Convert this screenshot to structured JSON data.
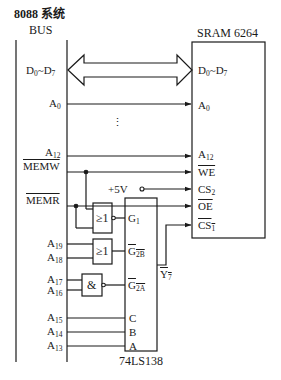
{
  "header": {
    "system_title": "8088 系统",
    "bus_label": "BUS"
  },
  "bus_signals": {
    "data": {
      "base": "D",
      "s1": "0",
      "sep": "~",
      "base2": "D",
      "s2": "7"
    },
    "a0": {
      "base": "A",
      "sub": "0"
    },
    "ellipsis": "⋮",
    "a12": {
      "base": "A",
      "sub": "12"
    },
    "memw": "MEMW",
    "memr": "MEMR",
    "a19": {
      "base": "A",
      "sub": "19"
    },
    "a18": {
      "base": "A",
      "sub": "18"
    },
    "a17": {
      "base": "A",
      "sub": "17"
    },
    "a16": {
      "base": "A",
      "sub": "16"
    },
    "a15": {
      "base": "A",
      "sub": "15"
    },
    "a14": {
      "base": "A",
      "sub": "14"
    },
    "a13": {
      "base": "A",
      "sub": "13"
    }
  },
  "power": "+5V",
  "sram": {
    "title": "SRAM 6264",
    "pins": {
      "data": {
        "base": "D",
        "s1": "0",
        "sep": "~",
        "base2": "D",
        "s2": "7"
      },
      "a0": {
        "base": "A",
        "sub": "0"
      },
      "a12": {
        "base": "A",
        "sub": "12"
      },
      "we": "WE",
      "cs2": {
        "base": "CS",
        "sub": "2"
      },
      "oe": "OE",
      "cs1": {
        "base": "CS",
        "sub": "1"
      }
    }
  },
  "gates": {
    "or1": "≥1",
    "or2": "≥1",
    "nand": "&"
  },
  "decoder": {
    "title": "74LS138",
    "pins": {
      "g1": {
        "base": "G",
        "sub": "1"
      },
      "g2b": {
        "base": "G",
        "sub": "2B"
      },
      "g2a": {
        "base": "G",
        "sub": "2A"
      },
      "c": "C",
      "b": "B",
      "a": "A",
      "y7": {
        "base": "Y",
        "sub": "7"
      }
    }
  }
}
